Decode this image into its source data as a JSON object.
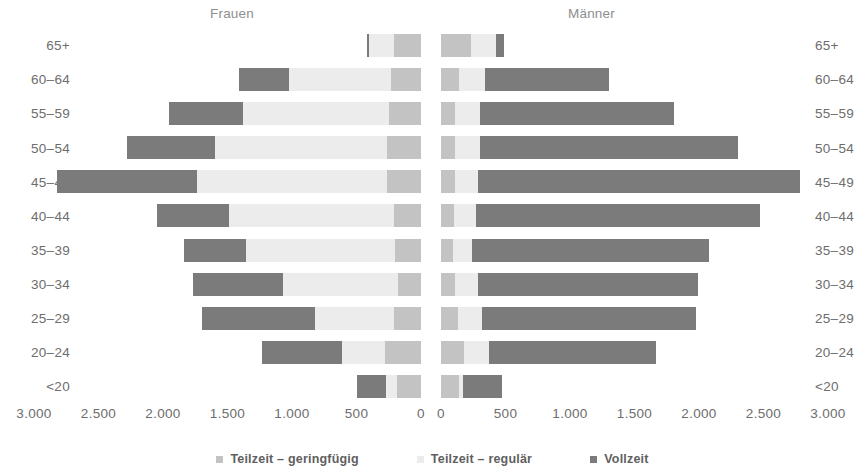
{
  "chart_data": {
    "type": "bar",
    "subtype": "population-pyramid-stacked",
    "title": "",
    "xlabel": "",
    "ylabel": "",
    "grid": false,
    "legend_position": "bottom",
    "group_labels": {
      "left": "Frauen",
      "right": "Männer"
    },
    "categories": [
      "65+",
      "60–64",
      "55–59",
      "50–54",
      "45–49",
      "40–44",
      "35–39",
      "30–34",
      "25–29",
      "20–24",
      "<20"
    ],
    "axis": {
      "left_ticks": [
        "3.000",
        "2.500",
        "2.000",
        "1.500",
        "1.000",
        "500",
        "0"
      ],
      "right_ticks": [
        "0",
        "500",
        "1.000",
        "1.500",
        "2.000",
        "2.500",
        "3.000"
      ],
      "max": 3000,
      "tick_step": 500
    },
    "series": [
      {
        "name": "Teilzeit – geringügig_dummy",
        "key": "geringfuegig",
        "label": "Teilzeit – geringfügig",
        "color": "#c3c3c3"
      },
      {
        "name": "Teilzeit – regulär",
        "key": "regulaer",
        "label": "Teilzeit – regulär",
        "color": "#ececec"
      },
      {
        "name": "Vollzeit",
        "key": "vollzeit",
        "label": "Vollzeit",
        "color": "#7b7b7b"
      }
    ],
    "rows": [
      {
        "category": "65+",
        "frauen": {
          "geringfuegig": 210,
          "regulaer": 190,
          "vollzeit": 20
        },
        "maenner": {
          "geringfuegig": 230,
          "regulaer": 200,
          "vollzeit": 60
        }
      },
      {
        "category": "60–64",
        "frauen": {
          "geringfuegig": 230,
          "regulaer": 790,
          "vollzeit": 390
        },
        "maenner": {
          "geringfuegig": 140,
          "regulaer": 200,
          "vollzeit": 960
        }
      },
      {
        "category": "55–59",
        "frauen": {
          "geringfuegig": 250,
          "regulaer": 1130,
          "vollzeit": 570
        },
        "maenner": {
          "geringfuegig": 110,
          "regulaer": 190,
          "vollzeit": 1510
        }
      },
      {
        "category": "50–54",
        "frauen": {
          "geringfuegig": 260,
          "regulaer": 1340,
          "vollzeit": 680
        },
        "maenner": {
          "geringfuegig": 110,
          "regulaer": 190,
          "vollzeit": 2000
        }
      },
      {
        "category": "45–49",
        "frauen": {
          "geringfuegig": 260,
          "regulaer": 1480,
          "vollzeit": 1080
        },
        "maenner": {
          "geringfuegig": 110,
          "regulaer": 180,
          "vollzeit": 2490
        }
      },
      {
        "category": "40–44",
        "frauen": {
          "geringfuegig": 210,
          "regulaer": 1280,
          "vollzeit": 560
        },
        "maenner": {
          "geringfuegig": 100,
          "regulaer": 170,
          "vollzeit": 2200
        }
      },
      {
        "category": "35–39",
        "frauen": {
          "geringfuegig": 200,
          "regulaer": 1160,
          "vollzeit": 480
        },
        "maenner": {
          "geringfuegig": 90,
          "regulaer": 150,
          "vollzeit": 1840
        }
      },
      {
        "category": "30–34",
        "frauen": {
          "geringfuegig": 180,
          "regulaer": 890,
          "vollzeit": 700
        },
        "maenner": {
          "geringfuegig": 110,
          "regulaer": 180,
          "vollzeit": 1700
        }
      },
      {
        "category": "25–29",
        "frauen": {
          "geringfuegig": 210,
          "regulaer": 610,
          "vollzeit": 880
        },
        "maenner": {
          "geringfuegig": 130,
          "regulaer": 190,
          "vollzeit": 1660
        }
      },
      {
        "category": "20–24",
        "frauen": {
          "geringfuegig": 280,
          "regulaer": 330,
          "vollzeit": 620
        },
        "maenner": {
          "geringfuegig": 180,
          "regulaer": 190,
          "vollzeit": 1300
        }
      },
      {
        "category": "<20",
        "frauen": {
          "geringfuegig": 190,
          "regulaer": 80,
          "vollzeit": 230
        },
        "maenner": {
          "geringfuegig": 140,
          "regulaer": 30,
          "vollzeit": 300
        }
      }
    ]
  }
}
